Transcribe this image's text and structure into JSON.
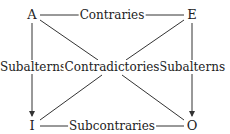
{
  "diagram": {
    "nodes": {
      "A": "A",
      "E": "E",
      "I": "I",
      "O": "O"
    },
    "edges": {
      "top": "Contraries",
      "bottom": "Subcontraries",
      "left": "Subalterns",
      "right": "Subalterns",
      "diagonals": "Contradictories"
    },
    "colors": {
      "line": "#333333",
      "text": "#222222"
    }
  }
}
